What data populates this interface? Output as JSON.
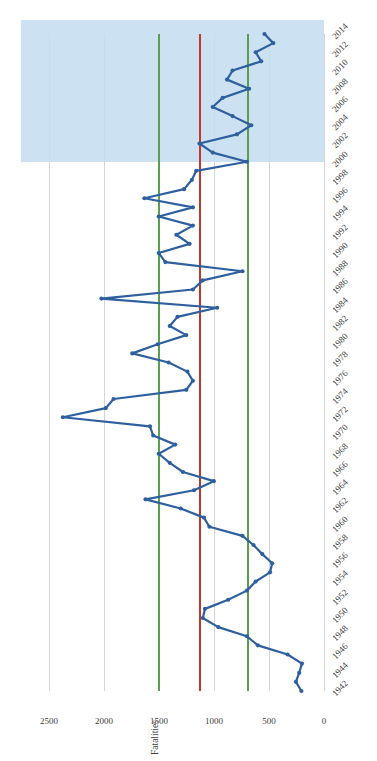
{
  "chart_data": {
    "type": "line",
    "title": "",
    "orientation": "rotated-90",
    "xlabel": "",
    "ylabel": "Fatalities",
    "axis_title": "Fatalities",
    "categories_label": "Year",
    "ylim": [
      0,
      2750
    ],
    "y_ticks": [
      0,
      500,
      1000,
      1500,
      2000,
      2500
    ],
    "y_tick_labels": [
      "0",
      "500",
      "1000",
      "1500",
      "2000",
      "2500"
    ],
    "grid": true,
    "legend": "none",
    "series_name": "Fatalities",
    "series_color": "#2e5f9e",
    "marker": "circle",
    "reference_lines": [
      {
        "name": "mean-line",
        "value": 1130,
        "color": "#c0392b",
        "label": ""
      },
      {
        "name": "upper-band-line",
        "value": 1510,
        "color": "#5a9e52",
        "label": ""
      },
      {
        "name": "lower-band-line",
        "value": 700,
        "color": "#5a9e52",
        "label": ""
      }
    ],
    "shaded_region": {
      "name": "highlight-band",
      "from": 2000,
      "to": 2014,
      "color": "#c3dcee"
    },
    "x": [
      1942,
      1943,
      1944,
      1945,
      1946,
      1947,
      1948,
      1949,
      1950,
      1951,
      1952,
      1953,
      1954,
      1955,
      1956,
      1957,
      1958,
      1959,
      1960,
      1961,
      1962,
      1963,
      1964,
      1965,
      1966,
      1967,
      1968,
      1969,
      1970,
      1971,
      1972,
      1973,
      1974,
      1975,
      1976,
      1977,
      1978,
      1979,
      1980,
      1981,
      1982,
      1983,
      1984,
      1985,
      1986,
      1987,
      1988,
      1989,
      1990,
      1991,
      1992,
      1993,
      1994,
      1995,
      1996,
      1997,
      1998,
      1999,
      2000,
      2001,
      2002,
      2003,
      2004,
      2005,
      2006,
      2007,
      2008,
      2009,
      2010,
      2011,
      2012,
      2013,
      2014
    ],
    "tick_years": [
      1942,
      1944,
      1946,
      1948,
      1950,
      1952,
      1954,
      1956,
      1958,
      1960,
      1962,
      1964,
      1966,
      1968,
      1970,
      1972,
      1974,
      1976,
      1978,
      1980,
      1982,
      1984,
      1986,
      1988,
      1990,
      1992,
      1994,
      1996,
      1998,
      2000,
      2002,
      2004,
      2006,
      2008,
      2010,
      2012,
      2014
    ],
    "values": [
      205,
      255,
      225,
      200,
      330,
      600,
      700,
      960,
      1100,
      1080,
      870,
      700,
      620,
      490,
      470,
      560,
      640,
      740,
      1040,
      1090,
      1300,
      1620,
      1180,
      1000,
      1280,
      1400,
      1500,
      1350,
      1550,
      1580,
      2370,
      1980,
      1910,
      1250,
      1190,
      1240,
      1410,
      1740,
      1510,
      1250,
      1400,
      1330,
      970,
      2020,
      1190,
      1100,
      740,
      1440,
      1500,
      1220,
      1340,
      1190,
      1500,
      1190,
      1630,
      1270,
      1200,
      1160,
      700,
      1010,
      1130,
      790,
      660,
      830,
      1010,
      920,
      680,
      880,
      830,
      570,
      620,
      460,
      540
    ]
  },
  "axis": {
    "value_axis_title": "Fatalities"
  }
}
